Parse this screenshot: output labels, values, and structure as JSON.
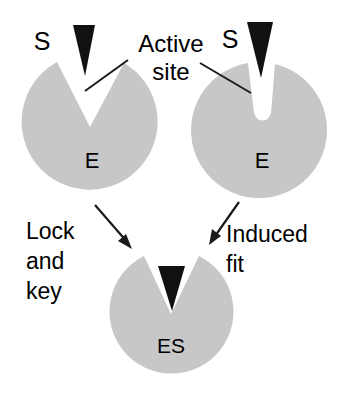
{
  "figure": {
    "background_color": "#ffffff",
    "enzyme_color": "#c7c7c7",
    "substrate_color": "#111111",
    "line_color": "#1a1a1a",
    "width": 342,
    "height": 399
  },
  "labels": {
    "substrate_left": "S",
    "substrate_right": "S",
    "enzyme_left": "E",
    "enzyme_right": "E",
    "complex": "ES",
    "active_site_line1": "Active",
    "active_site_line2": "site",
    "lock_and_key_line1": "Lock",
    "lock_and_key_line2": "and",
    "lock_and_key_line3": "key",
    "induced_fit_line1": "Induced",
    "induced_fit_line2": "fit"
  },
  "panels": [
    {
      "id": "lock-and-key",
      "enzyme_label": "E",
      "substrate_label": "S",
      "notch_shape": "wide-v-wedge",
      "mechanism": "Lock and key"
    },
    {
      "id": "induced-fit",
      "enzyme_label": "E",
      "substrate_label": "S",
      "notch_shape": "narrow-u-slot",
      "mechanism": "Induced fit"
    },
    {
      "id": "complex",
      "enzyme_label": "ES",
      "notch_shape": "wide-v-wedge-filled",
      "mechanism": "bound complex"
    }
  ]
}
